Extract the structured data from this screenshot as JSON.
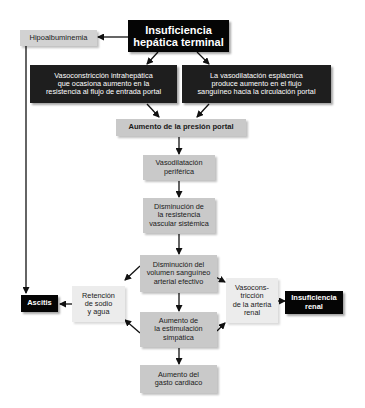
{
  "title": "Insuficiencia hepática terminal",
  "nodes": {
    "insuficiencia_hepatica": "Insuficiencia\nhepática terminal",
    "hipoalbuminemia": "Hipoalbuminemia",
    "vasoconstriccion_intrahepatica": "Vasoconstricción intrahepática\nque ocasiona aumento en la\nresistencia al flujo de entrada portal",
    "vasodilatacion_esplacnica": "La vasodilatación esplácnica\nproduce aumento en el flujo\nsanguíneo hacia la circulación portal",
    "aumento_presion_portal": "Aumento de la presión portal",
    "vasodilatacion_periferica": "Vasodilatación\nperiférica",
    "disminucion_resistencia": "Disminución de\nla resistencia\nvascular sistémica",
    "disminucion_volumen": "Disminución del\nvolumen sanguíneo\narterial efectivo",
    "retencion_sodio": "Retención\nde sodio\ny agua",
    "ascitis": "Ascitis",
    "vasoconstriccion_renal": "Vasocons-\ntricción\nde la arteria\nrenal",
    "insuficiencia_renal": "Insuficiencia\nrenal",
    "aumento_estimulacion": "Aumento de\nla estimulación\nsimpática",
    "aumento_gasto": "Aumento del\ngasto cardiaco"
  },
  "colors": {
    "dark_box": "#1e1e1e",
    "black_box": "#050505",
    "gray_box": "#c9c9c9",
    "light_box": "#ececec",
    "arrow": "#111111"
  }
}
